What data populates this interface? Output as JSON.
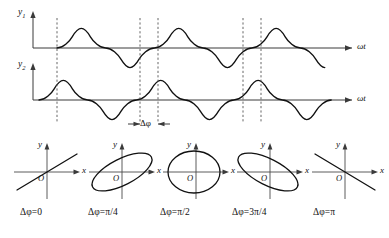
{
  "figure": {
    "background_color": "#ffffff",
    "stroke_color": "#111111"
  },
  "waveforms": {
    "top": {
      "y_axis_label": "y",
      "y_axis_subscript": "1",
      "x_axis_label": "ωt",
      "baseline_y": 48,
      "amplitude": 15,
      "period": 97,
      "phase_start_x": 57,
      "cycles": 2.6
    },
    "bottom": {
      "y_axis_label": "y",
      "y_axis_subscript": "2",
      "x_axis_label": "ωt",
      "baseline_y": 100,
      "amplitude": 15,
      "period": 97,
      "phase_start_x": 39,
      "cycles": 2.6
    },
    "dashed_guides_x": [
      57,
      140,
      158,
      243,
      261
    ],
    "phase_marker": {
      "label": "Δφ",
      "left_x": 140,
      "right_x": 158,
      "y": 122
    }
  },
  "lissajous": {
    "axis_labels": {
      "x": "x",
      "y": "y",
      "origin": "O"
    },
    "panels": [
      {
        "id": "panel-0",
        "caption": "Δφ=0",
        "shape": "line",
        "phase": "0",
        "tilt_deg": -27,
        "semi_major": 34,
        "semi_minor": 0,
        "center_x": 47
      },
      {
        "id": "panel-pi-4",
        "caption": "Δφ=π/4",
        "shape": "ellipse",
        "phase": "π/4",
        "tilt_deg": -27,
        "semi_major": 33,
        "semi_minor": 13,
        "center_x": 122
      },
      {
        "id": "panel-pi-2",
        "caption": "Δφ=π/2",
        "shape": "ellipse",
        "phase": "π/2",
        "tilt_deg": 0,
        "semi_major": 26,
        "semi_minor": 21,
        "center_x": 196
      },
      {
        "id": "panel-3pi-4",
        "caption": "Δφ=3π/4",
        "shape": "ellipse",
        "phase": "3π/4",
        "tilt_deg": 27,
        "semi_major": 33,
        "semi_minor": 13,
        "center_x": 270
      },
      {
        "id": "panel-pi",
        "caption": "Δφ=π",
        "shape": "line",
        "phase": "π",
        "tilt_deg": 27,
        "semi_major": 34,
        "semi_minor": 0,
        "center_x": 345
      }
    ],
    "panel_center_y": 172,
    "caption_y": 213
  }
}
